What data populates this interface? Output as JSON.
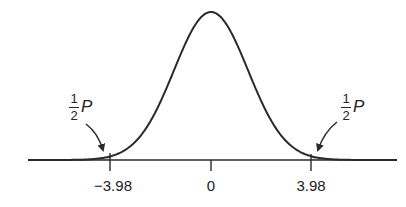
{
  "chart_data": {
    "type": "area",
    "title": "",
    "xlabel": "",
    "ylabel": "",
    "x_ticks": [
      {
        "value": -3.98,
        "label": "−3.98"
      },
      {
        "value": 0,
        "label": "0"
      },
      {
        "value": 3.98,
        "label": "3.98"
      }
    ],
    "curve": {
      "kind": "normal_pdf",
      "mean": 0,
      "peak_at": 0
    },
    "shaded_regions": [
      {
        "side": "left",
        "from": "-inf",
        "to": -3.98,
        "label": "½P"
      },
      {
        "side": "right",
        "from": 3.98,
        "to": "inf",
        "label": "½P"
      }
    ],
    "annotations": [
      {
        "text_numerator": "1",
        "text_denominator": "2",
        "text_var": "P",
        "points_to": "left tail"
      },
      {
        "text_numerator": "1",
        "text_denominator": "2",
        "text_var": "P",
        "points_to": "right tail"
      }
    ],
    "grid": false,
    "legend": null
  },
  "labels": {
    "tick_left": "−3.98",
    "tick_center": "0",
    "tick_right": "3.98",
    "left_annotation": {
      "num": "1",
      "den": "2",
      "var": "P"
    },
    "right_annotation": {
      "num": "1",
      "den": "2",
      "var": "P"
    }
  },
  "colors": {
    "line": "#2a2a2a",
    "shade": "#d9d9d9",
    "background": "#ffffff"
  }
}
